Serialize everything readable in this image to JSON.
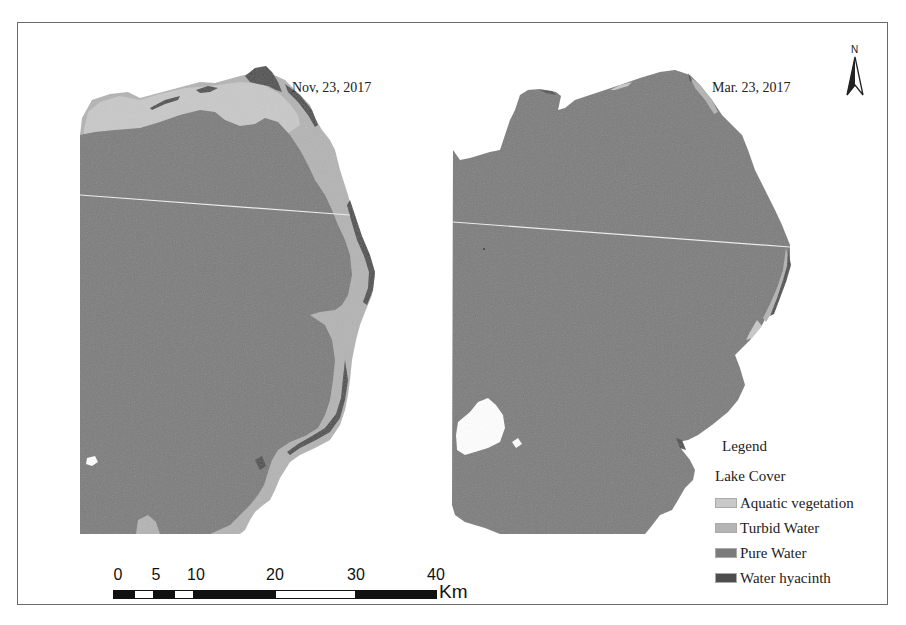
{
  "maps": {
    "left": {
      "title": "Nov, 23, 2017"
    },
    "right": {
      "title": "Mar. 23, 2017"
    }
  },
  "north_arrow": {
    "label": "N"
  },
  "legend": {
    "title": "Legend",
    "subtitle": "Lake Cover",
    "items": [
      {
        "label": "Aquatic vegetation",
        "color": "#c8c8c8"
      },
      {
        "label": "Turbid Water",
        "color": "#b2b2b2"
      },
      {
        "label": "Pure Water",
        "color": "#7a7a7a"
      },
      {
        "label": "Water hyacinth",
        "color": "#4a4a4a"
      }
    ]
  },
  "scale_bar": {
    "ticks": [
      "0",
      "5",
      "10",
      "20",
      "30",
      "40"
    ],
    "unit": "Km"
  },
  "colors": {
    "pure_water": "#7b7b7b",
    "turbid_water": "#b4b4b4",
    "aquatic_vegetation": "#c9c9c9",
    "water_hyacinth": "#4d4d4d",
    "frame": "#6a6a6a"
  }
}
